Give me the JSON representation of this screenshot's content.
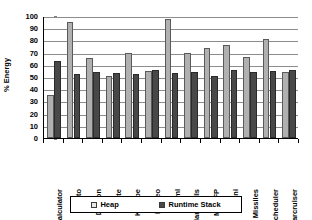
{
  "chart_data": {
    "type": "bar",
    "title": "",
    "xlabel": "",
    "ylabel": "% Energy",
    "ylim": [
      0,
      100
    ],
    "yticks": [
      0,
      10,
      20,
      30,
      40,
      50,
      60,
      70,
      80,
      90,
      100
    ],
    "grid": true,
    "legend_position": "bottom",
    "categories": [
      "Calculator",
      "Crypto",
      "Dragon",
      "Elite",
      "Kshape",
      "Kvideo",
      "Kwml",
      "Manyballs",
      "MathFP",
      "Mini",
      "Missiles",
      "Scheduler",
      "Starcruiser"
    ],
    "series": [
      {
        "name": "Heap",
        "color": "#b0b0b0",
        "values": [
          35,
          95,
          65.5,
          50.5,
          70,
          55,
          97.5,
          70,
          73.5,
          76,
          66.5,
          81,
          54
        ]
      },
      {
        "name": "Runtime Stack",
        "color": "#484848",
        "values": [
          63.5,
          52.5,
          54.5,
          53.5,
          52.5,
          55.5,
          53,
          54.5,
          50.5,
          55.5,
          54.5,
          55,
          55.5
        ]
      }
    ]
  },
  "legend": {
    "entries": [
      {
        "label": "Heap"
      },
      {
        "label": "Runtime Stack"
      }
    ]
  }
}
